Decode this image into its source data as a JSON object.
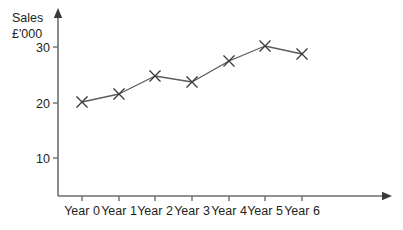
{
  "chart_data": {
    "type": "line",
    "title": "",
    "subtitle": "",
    "ylabel_line1": "Sales",
    "ylabel_line2": "£'000",
    "xlabel": "",
    "categories": [
      "Year 0",
      "Year 1",
      "Year 2",
      "Year 3",
      "Year 4",
      "Year 5",
      "Year 6"
    ],
    "values": [
      20.0,
      21.4,
      24.6,
      23.5,
      27.4,
      30.2,
      28.7
    ],
    "series": [
      {
        "name": "Sales",
        "values": [
          20.0,
          21.4,
          24.6,
          23.5,
          27.4,
          30.2,
          28.7
        ]
      }
    ],
    "y_ticks": [
      10,
      20,
      30
    ],
    "y_tick_labels": [
      "10",
      "20",
      "30"
    ],
    "ylim": [
      0,
      34
    ],
    "grid": false,
    "legend": false,
    "legend_position": "none",
    "marker": "x",
    "line_color": "#5b5b60",
    "marker_color": "#3a3a3c",
    "axis_color": "#6d6e70",
    "text_color": "#231f20",
    "background_color": "#ffffff",
    "x_axis_arrow": true,
    "y_axis_arrow": true
  },
  "geometry": {
    "origin_x": 58,
    "origin_y": 196,
    "y_axis_top": 14,
    "x_axis_right": 386,
    "point_x": [
      82,
      119,
      155,
      192,
      229,
      265,
      302
    ],
    "point_y": [
      102,
      94,
      76,
      82,
      61,
      46,
      54
    ],
    "y_tick_y": [
      158,
      103,
      47
    ],
    "marker_radius": 5.2,
    "tick_len": 5,
    "x_tick_y_top": 196,
    "x_tick_y_bottom": 201,
    "x_label_y": 215,
    "y_label_dx": -8,
    "title_x": 12,
    "title_y1": 22,
    "title_y2": 38
  }
}
